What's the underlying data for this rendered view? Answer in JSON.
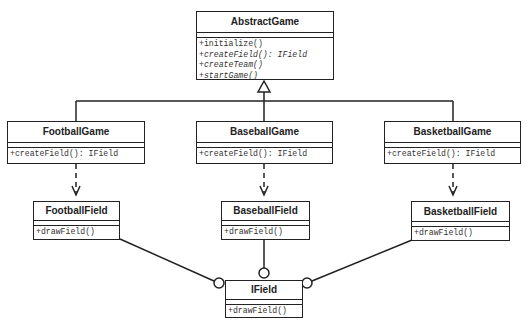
{
  "diagram": {
    "type": "UML class diagram",
    "classes": {
      "abstract_game": {
        "name": "AbstractGame",
        "operations": [
          {
            "text": "+initialize()",
            "abstract": false
          },
          {
            "text": "+createField(): IField",
            "abstract": true
          },
          {
            "text": "+createTeam()",
            "abstract": true
          },
          {
            "text": "+startGame()",
            "abstract": true
          }
        ]
      },
      "football_game": {
        "name": "FootballGame",
        "operations": [
          {
            "text": "+createField(): IField"
          }
        ]
      },
      "baseball_game": {
        "name": "BaseballGame",
        "operations": [
          {
            "text": "+createField(): IField"
          }
        ]
      },
      "basketball_game": {
        "name": "BasketballGame",
        "operations": [
          {
            "text": "+createField(): IField"
          }
        ]
      },
      "football_field": {
        "name": "FootballField",
        "operations": [
          {
            "text": "+drawField()"
          }
        ]
      },
      "baseball_field": {
        "name": "BaseballField",
        "operations": [
          {
            "text": "+drawField()"
          }
        ]
      },
      "basketball_field": {
        "name": "BasketballField",
        "operations": [
          {
            "text": "+drawField()"
          }
        ]
      },
      "ifield": {
        "name": "IField",
        "operations": [
          {
            "text": "+drawField()"
          }
        ]
      }
    },
    "relationships": [
      {
        "type": "generalization",
        "from": "FootballGame",
        "to": "AbstractGame"
      },
      {
        "type": "generalization",
        "from": "BaseballGame",
        "to": "AbstractGame"
      },
      {
        "type": "generalization",
        "from": "BasketballGame",
        "to": "AbstractGame"
      },
      {
        "type": "dependency",
        "from": "FootballGame",
        "to": "FootballField"
      },
      {
        "type": "dependency",
        "from": "BaseballGame",
        "to": "BaseballField"
      },
      {
        "type": "dependency",
        "from": "BasketballGame",
        "to": "BasketballField"
      },
      {
        "type": "interface-realization (lollipop)",
        "from": "FootballField",
        "to": "IField"
      },
      {
        "type": "interface-realization (lollipop)",
        "from": "BaseballField",
        "to": "IField"
      },
      {
        "type": "interface-realization (lollipop)",
        "from": "BasketballField",
        "to": "IField"
      }
    ],
    "colors": {
      "line": "#222222",
      "background": "#ffffff",
      "text": "#222222"
    }
  }
}
